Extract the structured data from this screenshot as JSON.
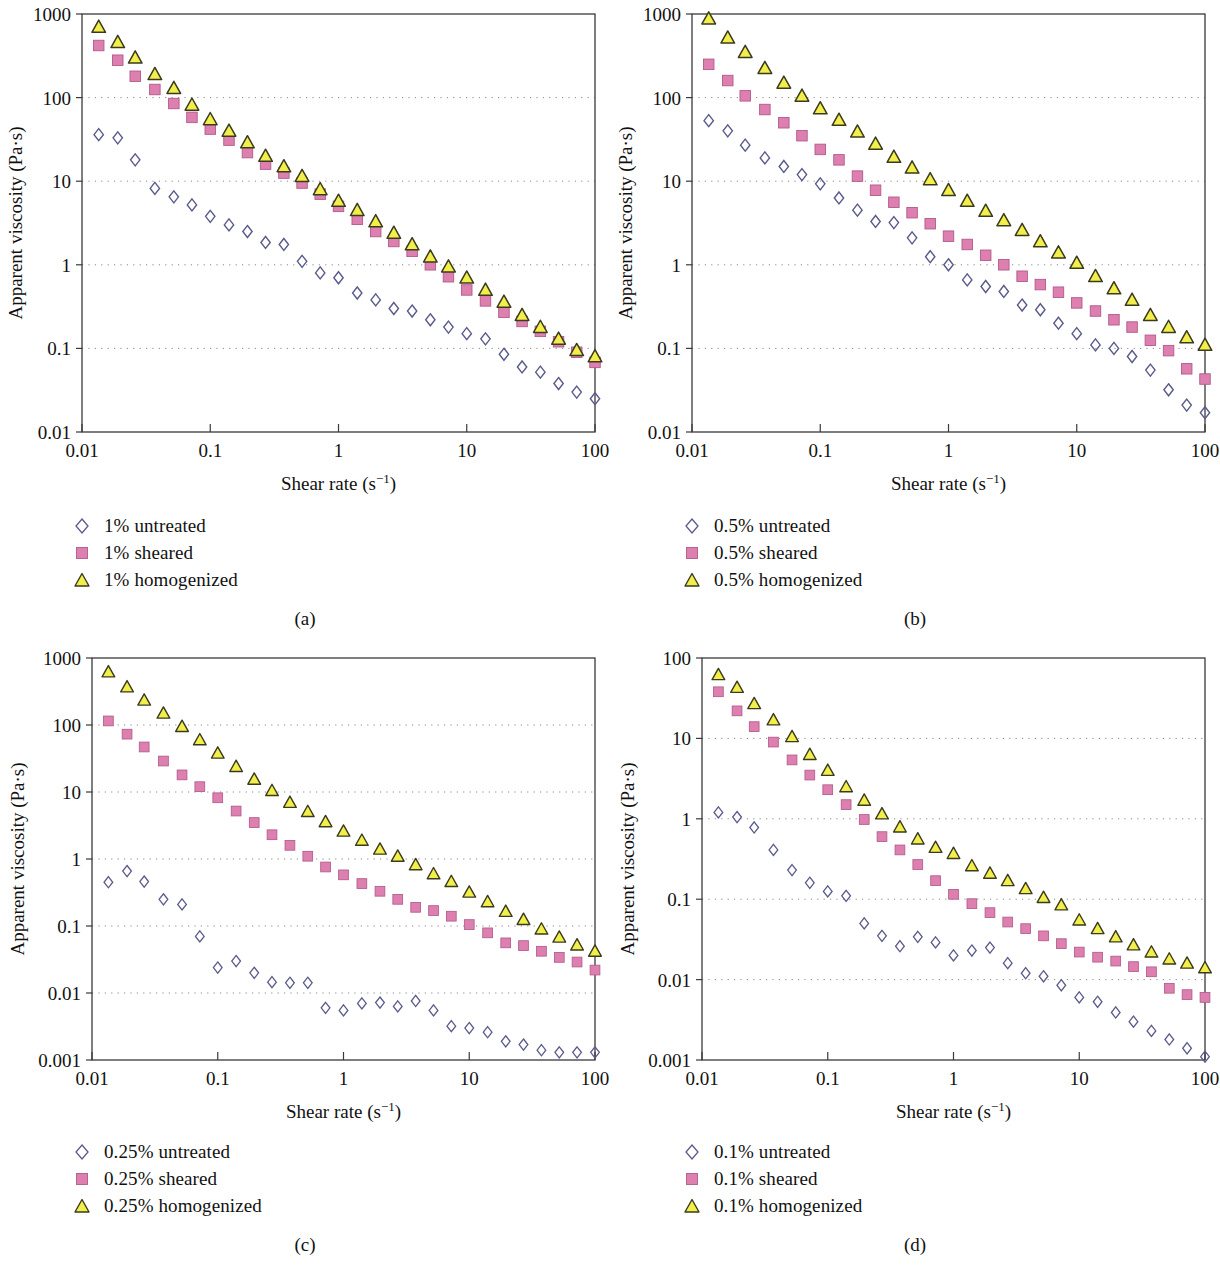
{
  "figure": {
    "background": "#ffffff",
    "axis_color": "#3a3a3a",
    "grid_color": "#8a8a8a"
  },
  "series_style": {
    "untreated": {
      "marker": "diamond-open",
      "stroke": "#5a5a8c",
      "fill": "none",
      "name": "untreated-marker"
    },
    "sheared": {
      "marker": "square-filled",
      "stroke": "#b05a8a",
      "fill": "#dd80b0",
      "name": "sheared-marker"
    },
    "homogenized": {
      "marker": "triangle-filled",
      "stroke": "#3a3a20",
      "fill": "#f2ee4a",
      "name": "homogenized-marker"
    }
  },
  "axes_common": {
    "xlabel_main": "Shear rate (s",
    "xlabel_sup": "−1",
    "xlabel_close": ")",
    "ylabel": "Apparent viscosity (Pa·s)",
    "xticks": [
      "0.01",
      "0.1",
      "1",
      "10",
      "100"
    ],
    "xlim": [
      0.01,
      100
    ]
  },
  "chart_data": [
    {
      "id": "a",
      "type": "scatter",
      "caption": "(a)",
      "title": "",
      "xlabel": "Shear rate (s−1)",
      "ylabel": "Apparent viscosity (Pa·s)",
      "xscale": "log",
      "yscale": "log",
      "xlim": [
        0.01,
        100
      ],
      "ylim": [
        0.01,
        1000
      ],
      "xticks": [
        0.01,
        0.1,
        1,
        10,
        100
      ],
      "xticklabels": [
        "0.01",
        "0.1",
        "1",
        "10",
        "100"
      ],
      "yticks": [
        0.01,
        0.1,
        1,
        10,
        100,
        1000
      ],
      "yticklabels": [
        "0.01",
        "0.1",
        "1",
        "10",
        "100",
        "1000"
      ],
      "grid": "horizontal-dotted",
      "legend_position": "below-left",
      "series": [
        {
          "name": "1% untreated",
          "marker": "diamond-open",
          "x": [
            0.0135,
            0.019,
            0.026,
            0.037,
            0.052,
            0.072,
            0.1,
            0.14,
            0.195,
            0.27,
            0.375,
            0.52,
            0.72,
            1.0,
            1.4,
            1.95,
            2.7,
            3.75,
            5.2,
            7.2,
            10,
            14,
            19.5,
            27,
            37.5,
            52,
            72,
            100
          ],
          "y": [
            36,
            33,
            18,
            8.2,
            6.5,
            5.2,
            3.8,
            3.0,
            2.5,
            1.85,
            1.75,
            1.1,
            0.8,
            0.7,
            0.46,
            0.38,
            0.3,
            0.28,
            0.22,
            0.18,
            0.15,
            0.13,
            0.085,
            0.06,
            0.052,
            0.038,
            0.03,
            0.025
          ]
        },
        {
          "name": "1% sheared",
          "marker": "square-filled",
          "x": [
            0.0135,
            0.019,
            0.026,
            0.037,
            0.052,
            0.072,
            0.1,
            0.14,
            0.195,
            0.27,
            0.375,
            0.52,
            0.72,
            1.0,
            1.4,
            1.95,
            2.7,
            3.75,
            5.2,
            7.2,
            10,
            14,
            19.5,
            27,
            37.5,
            52,
            72,
            100
          ],
          "y": [
            420,
            280,
            180,
            125,
            85,
            58,
            42,
            31,
            22,
            16,
            12.5,
            9.5,
            7.0,
            5.0,
            3.5,
            2.5,
            1.9,
            1.45,
            1.0,
            0.72,
            0.5,
            0.37,
            0.27,
            0.21,
            0.16,
            0.12,
            0.09,
            0.068
          ]
        },
        {
          "name": "1% homogenized",
          "marker": "triangle-filled",
          "x": [
            0.0135,
            0.019,
            0.026,
            0.037,
            0.052,
            0.072,
            0.1,
            0.14,
            0.195,
            0.27,
            0.375,
            0.52,
            0.72,
            1.0,
            1.4,
            1.95,
            2.7,
            3.75,
            5.2,
            7.2,
            10,
            14,
            19.5,
            27,
            37.5,
            52,
            72,
            100
          ],
          "y": [
            700,
            460,
            300,
            190,
            130,
            82,
            55,
            40,
            29,
            20,
            15,
            11.5,
            8.0,
            5.8,
            4.5,
            3.3,
            2.4,
            1.75,
            1.25,
            0.95,
            0.7,
            0.5,
            0.36,
            0.25,
            0.18,
            0.13,
            0.095,
            0.08
          ]
        }
      ]
    },
    {
      "id": "b",
      "type": "scatter",
      "caption": "(b)",
      "title": "",
      "xlabel": "Shear rate (s−1)",
      "ylabel": "Apparent viscosity (Pa·s)",
      "xscale": "log",
      "yscale": "log",
      "xlim": [
        0.01,
        100
      ],
      "ylim": [
        0.01,
        1000
      ],
      "xticks": [
        0.01,
        0.1,
        1,
        10,
        100
      ],
      "xticklabels": [
        "0.01",
        "0.1",
        "1",
        "10",
        "100"
      ],
      "yticks": [
        0.01,
        0.1,
        1,
        10,
        100,
        1000
      ],
      "yticklabels": [
        "0.01",
        "0.1",
        "1",
        "10",
        "100",
        "1000"
      ],
      "grid": "horizontal-dotted",
      "legend_position": "below-left",
      "series": [
        {
          "name": "0.5% untreated",
          "marker": "diamond-open",
          "x": [
            0.0135,
            0.019,
            0.026,
            0.037,
            0.052,
            0.072,
            0.1,
            0.14,
            0.195,
            0.27,
            0.375,
            0.52,
            0.72,
            1.0,
            1.4,
            1.95,
            2.7,
            3.75,
            5.2,
            7.2,
            10,
            14,
            19.5,
            27,
            37.5,
            52,
            72,
            100
          ],
          "y": [
            53,
            40,
            27,
            19,
            15,
            12,
            9.3,
            6.3,
            4.5,
            3.3,
            3.2,
            2.1,
            1.25,
            1.0,
            0.66,
            0.55,
            0.48,
            0.33,
            0.29,
            0.2,
            0.15,
            0.11,
            0.1,
            0.08,
            0.055,
            0.032,
            0.021,
            0.017
          ]
        },
        {
          "name": "0.5% sheared",
          "marker": "square-filled",
          "x": [
            0.0135,
            0.019,
            0.026,
            0.037,
            0.052,
            0.072,
            0.1,
            0.14,
            0.195,
            0.27,
            0.375,
            0.52,
            0.72,
            1.0,
            1.4,
            1.95,
            2.7,
            3.75,
            5.2,
            7.2,
            10,
            14,
            19.5,
            27,
            37.5,
            52,
            72,
            100
          ],
          "y": [
            250,
            160,
            105,
            72,
            50,
            35,
            24,
            18,
            11.5,
            7.8,
            5.6,
            4.2,
            3.1,
            2.2,
            1.75,
            1.3,
            1.0,
            0.73,
            0.58,
            0.47,
            0.35,
            0.28,
            0.22,
            0.18,
            0.125,
            0.094,
            0.057,
            0.043
          ]
        },
        {
          "name": "0.5% homogenized",
          "marker": "triangle-filled",
          "x": [
            0.0135,
            0.019,
            0.026,
            0.037,
            0.052,
            0.072,
            0.1,
            0.14,
            0.195,
            0.27,
            0.375,
            0.52,
            0.72,
            1.0,
            1.4,
            1.95,
            2.7,
            3.75,
            5.2,
            7.2,
            10,
            14,
            19.5,
            27,
            37.5,
            52,
            72,
            100
          ],
          "y": [
            880,
            520,
            350,
            225,
            150,
            105,
            74,
            54,
            39,
            28,
            19.5,
            14.5,
            10.5,
            7.8,
            5.8,
            4.4,
            3.4,
            2.6,
            1.9,
            1.4,
            1.05,
            0.73,
            0.52,
            0.38,
            0.25,
            0.18,
            0.135,
            0.11
          ]
        }
      ]
    },
    {
      "id": "c",
      "type": "scatter",
      "caption": "(c)",
      "title": "",
      "xlabel": "Shear rate (s−1)",
      "ylabel": "Apparent viscosity (Pa·s)",
      "xscale": "log",
      "yscale": "log",
      "xlim": [
        0.01,
        100
      ],
      "ylim": [
        0.001,
        1000
      ],
      "xticks": [
        0.01,
        0.1,
        1,
        10,
        100
      ],
      "xticklabels": [
        "0.01",
        "0.1",
        "1",
        "10",
        "100"
      ],
      "yticks": [
        0.001,
        0.01,
        0.1,
        1,
        10,
        100,
        1000
      ],
      "yticklabels": [
        "0.001",
        "0.01",
        "0.1",
        "1",
        "10",
        "100",
        "1000"
      ],
      "grid": "horizontal-dotted",
      "legend_position": "below-left",
      "series": [
        {
          "name": "0.25% untreated",
          "marker": "diamond-open",
          "x": [
            0.0135,
            0.019,
            0.026,
            0.037,
            0.052,
            0.072,
            0.1,
            0.14,
            0.195,
            0.27,
            0.375,
            0.52,
            0.72,
            1.0,
            1.4,
            1.95,
            2.7,
            3.75,
            5.2,
            7.2,
            10,
            14,
            19.5,
            27,
            37.5,
            52,
            72,
            100
          ],
          "y": [
            0.45,
            0.66,
            0.46,
            0.25,
            0.21,
            0.07,
            0.024,
            0.03,
            0.02,
            0.0145,
            0.0142,
            0.0142,
            0.006,
            0.0055,
            0.007,
            0.0072,
            0.0063,
            0.0076,
            0.0055,
            0.0032,
            0.003,
            0.0026,
            0.0019,
            0.0017,
            0.0014,
            0.0013,
            0.0013,
            0.0013
          ]
        },
        {
          "name": "0.25% sheared",
          "marker": "square-filled",
          "x": [
            0.0135,
            0.019,
            0.026,
            0.037,
            0.052,
            0.072,
            0.1,
            0.14,
            0.195,
            0.27,
            0.375,
            0.52,
            0.72,
            1.0,
            1.4,
            1.95,
            2.7,
            3.75,
            5.2,
            7.2,
            10,
            14,
            19.5,
            27,
            37.5,
            52,
            72,
            100
          ],
          "y": [
            115,
            73,
            47,
            29,
            18,
            12,
            8.2,
            5.2,
            3.5,
            2.3,
            1.6,
            1.1,
            0.76,
            0.58,
            0.43,
            0.33,
            0.25,
            0.19,
            0.17,
            0.14,
            0.105,
            0.079,
            0.056,
            0.051,
            0.042,
            0.034,
            0.029,
            0.022
          ]
        },
        {
          "name": "0.25% homogenized",
          "marker": "triangle-filled",
          "x": [
            0.0135,
            0.019,
            0.026,
            0.037,
            0.052,
            0.072,
            0.1,
            0.14,
            0.195,
            0.27,
            0.375,
            0.52,
            0.72,
            1.0,
            1.4,
            1.95,
            2.7,
            3.75,
            5.2,
            7.2,
            10,
            14,
            19.5,
            27,
            37.5,
            52,
            72,
            100
          ],
          "y": [
            620,
            370,
            235,
            150,
            95,
            60,
            38,
            24,
            15.5,
            10.5,
            7.0,
            5.1,
            3.6,
            2.6,
            1.9,
            1.4,
            1.1,
            0.82,
            0.6,
            0.46,
            0.32,
            0.23,
            0.165,
            0.125,
            0.09,
            0.068,
            0.052,
            0.042
          ]
        }
      ]
    },
    {
      "id": "d",
      "type": "scatter",
      "caption": "(d)",
      "title": "",
      "xlabel": "Shear rate (s−1)",
      "ylabel": "Apparent viscosity (Pa·s)",
      "xscale": "log",
      "yscale": "log",
      "xlim": [
        0.01,
        100
      ],
      "ylim": [
        0.001,
        100
      ],
      "xticks": [
        0.01,
        0.1,
        1,
        10,
        100
      ],
      "xticklabels": [
        "0.01",
        "0.1",
        "1",
        "10",
        "100"
      ],
      "yticks": [
        0.001,
        0.01,
        0.1,
        1,
        10,
        100
      ],
      "yticklabels": [
        "0.001",
        "0.01",
        "0.1",
        "1",
        "10",
        "100"
      ],
      "grid": "horizontal-dotted",
      "legend_position": "below-left",
      "series": [
        {
          "name": "0.1% untreated",
          "marker": "diamond-open",
          "x": [
            0.0135,
            0.019,
            0.026,
            0.037,
            0.052,
            0.072,
            0.1,
            0.14,
            0.195,
            0.27,
            0.375,
            0.52,
            0.72,
            1.0,
            1.4,
            1.95,
            2.7,
            3.75,
            5.2,
            7.2,
            10,
            14,
            19.5,
            27,
            37.5,
            52,
            72,
            100
          ],
          "y": [
            1.2,
            1.05,
            0.78,
            0.41,
            0.23,
            0.16,
            0.125,
            0.11,
            0.05,
            0.035,
            0.026,
            0.034,
            0.029,
            0.02,
            0.023,
            0.025,
            0.016,
            0.012,
            0.011,
            0.0085,
            0.006,
            0.0053,
            0.0039,
            0.003,
            0.0023,
            0.0018,
            0.0014,
            0.0011
          ]
        },
        {
          "name": "0.1% sheared",
          "marker": "square-filled",
          "x": [
            0.0135,
            0.019,
            0.026,
            0.037,
            0.052,
            0.072,
            0.1,
            0.14,
            0.195,
            0.27,
            0.375,
            0.52,
            0.72,
            1.0,
            1.4,
            1.95,
            2.7,
            3.75,
            5.2,
            7.2,
            10,
            14,
            19.5,
            27,
            37.5,
            52,
            72,
            100
          ],
          "y": [
            38,
            22,
            14,
            9.0,
            5.4,
            3.5,
            2.3,
            1.5,
            0.98,
            0.6,
            0.41,
            0.27,
            0.17,
            0.115,
            0.088,
            0.068,
            0.052,
            0.043,
            0.035,
            0.028,
            0.022,
            0.019,
            0.017,
            0.0145,
            0.0125,
            0.0078,
            0.0065,
            0.006
          ]
        },
        {
          "name": "0.1% homogenized",
          "marker": "triangle-filled",
          "x": [
            0.0135,
            0.019,
            0.026,
            0.037,
            0.052,
            0.072,
            0.1,
            0.14,
            0.195,
            0.27,
            0.375,
            0.52,
            0.72,
            1.0,
            1.4,
            1.95,
            2.7,
            3.75,
            5.2,
            7.2,
            10,
            14,
            19.5,
            27,
            37.5,
            52,
            72,
            100
          ],
          "y": [
            62,
            43,
            27,
            17,
            10.5,
            6.3,
            4.0,
            2.5,
            1.7,
            1.15,
            0.79,
            0.56,
            0.44,
            0.37,
            0.26,
            0.21,
            0.17,
            0.135,
            0.105,
            0.085,
            0.055,
            0.043,
            0.034,
            0.027,
            0.022,
            0.018,
            0.016,
            0.014
          ]
        }
      ]
    }
  ],
  "panels": {
    "a": {
      "caption": "(a)",
      "legend": [
        {
          "label": "1% untreated",
          "type": "untreated"
        },
        {
          "label": "1% sheared",
          "type": "sheared"
        },
        {
          "label": "1% homogenized",
          "type": "homogenized"
        }
      ]
    },
    "b": {
      "caption": "(b)",
      "legend": [
        {
          "label": "0.5% untreated",
          "type": "untreated"
        },
        {
          "label": "0.5% sheared",
          "type": "sheared"
        },
        {
          "label": "0.5% homogenized",
          "type": "homogenized"
        }
      ]
    },
    "c": {
      "caption": "(c)",
      "legend": [
        {
          "label": "0.25% untreated",
          "type": "untreated"
        },
        {
          "label": "0.25% sheared",
          "type": "sheared"
        },
        {
          "label": "0.25% homogenized",
          "type": "homogenized"
        }
      ]
    },
    "d": {
      "caption": "(d)",
      "legend": [
        {
          "label": "0.1% untreated",
          "type": "untreated"
        },
        {
          "label": "0.1% sheared",
          "type": "sheared"
        },
        {
          "label": "0.1% homogenized",
          "type": "homogenized"
        }
      ]
    }
  }
}
